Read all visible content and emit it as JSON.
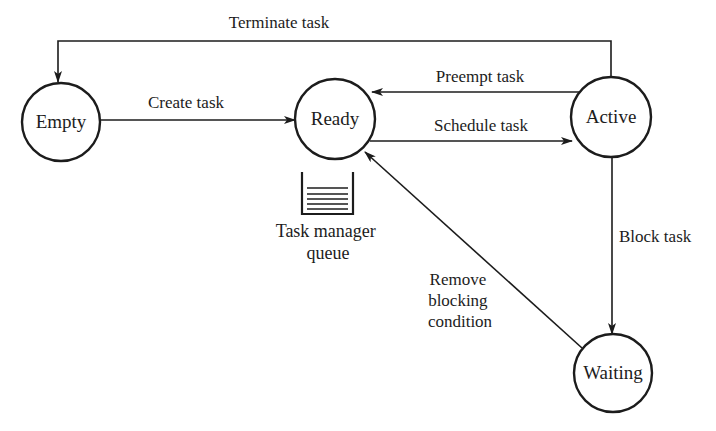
{
  "diagram": {
    "type": "state-transition",
    "colors": {
      "stroke": "#1c1c1c",
      "background": "#ffffff"
    },
    "states": [
      {
        "id": "empty",
        "label": "Empty",
        "cx": 61,
        "cy": 122,
        "r": 39
      },
      {
        "id": "ready",
        "label": "Ready",
        "cx": 335,
        "cy": 119,
        "r": 40
      },
      {
        "id": "active",
        "label": "Active",
        "cx": 611,
        "cy": 117,
        "r": 40
      },
      {
        "id": "waiting",
        "label": "Waiting",
        "cx": 613,
        "cy": 373,
        "r": 39
      }
    ],
    "transitions": [
      {
        "id": "terminate",
        "from": "active",
        "to": "empty",
        "label": "Terminate task"
      },
      {
        "id": "create",
        "from": "empty",
        "to": "ready",
        "label": "Create task"
      },
      {
        "id": "preempt",
        "from": "active",
        "to": "ready",
        "label": "Preempt task"
      },
      {
        "id": "schedule",
        "from": "ready",
        "to": "active",
        "label": "Schedule task"
      },
      {
        "id": "block",
        "from": "active",
        "to": "waiting",
        "label": "Block task"
      },
      {
        "id": "remove",
        "from": "waiting",
        "to": "ready",
        "label_lines": [
          "Remove",
          "blocking",
          "condition"
        ]
      }
    ],
    "queue": {
      "label_lines": [
        "Task manager",
        "queue"
      ],
      "icon": "queue-icon",
      "stack_lines": 5
    }
  }
}
